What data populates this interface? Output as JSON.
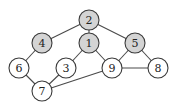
{
  "diagram": {
    "type": "undirected-graph",
    "colors": {
      "highlight_fill": "#d4d4d4",
      "normal_fill": "#ffffff",
      "stroke": "#3a3a3a",
      "edge": "#4a4a4a"
    },
    "node_radius": 10,
    "nodes": [
      {
        "id": "2",
        "label": "2",
        "x": 89,
        "y": 20,
        "highlighted": true
      },
      {
        "id": "4",
        "label": "4",
        "x": 42,
        "y": 43,
        "highlighted": true
      },
      {
        "id": "1",
        "label": "1",
        "x": 89,
        "y": 43,
        "highlighted": true
      },
      {
        "id": "5",
        "label": "5",
        "x": 135,
        "y": 43,
        "highlighted": true
      },
      {
        "id": "6",
        "label": "6",
        "x": 19,
        "y": 68,
        "highlighted": false
      },
      {
        "id": "3",
        "label": "3",
        "x": 66,
        "y": 68,
        "highlighted": false
      },
      {
        "id": "9",
        "label": "9",
        "x": 112,
        "y": 68,
        "highlighted": false
      },
      {
        "id": "8",
        "label": "8",
        "x": 158,
        "y": 68,
        "highlighted": false
      },
      {
        "id": "7",
        "label": "7",
        "x": 42,
        "y": 91,
        "highlighted": false
      }
    ],
    "edges": [
      [
        "2",
        "4"
      ],
      [
        "2",
        "1"
      ],
      [
        "2",
        "5"
      ],
      [
        "4",
        "6"
      ],
      [
        "1",
        "3"
      ],
      [
        "1",
        "9"
      ],
      [
        "5",
        "9"
      ],
      [
        "5",
        "8"
      ],
      [
        "9",
        "8"
      ],
      [
        "6",
        "7"
      ],
      [
        "3",
        "7"
      ],
      [
        "7",
        "9"
      ]
    ]
  }
}
